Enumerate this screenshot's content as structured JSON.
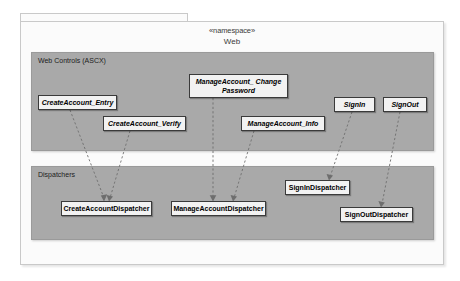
{
  "diagram": {
    "package": {
      "stereotype": "«namespace»",
      "name": "Web"
    },
    "layers": [
      {
        "id": "web-controls",
        "label": "Web Controls (ASCX)",
        "nodes": [
          {
            "id": "manageaccount-changepassword",
            "label": "ManageAccount_ Change\nPassword"
          },
          {
            "id": "createaccount-entry",
            "label": "CreateAccount_Entry"
          },
          {
            "id": "signin",
            "label": "SignIn"
          },
          {
            "id": "signout",
            "label": "SignOut"
          },
          {
            "id": "createaccount-verify",
            "label": "CreateAccount_Verify"
          },
          {
            "id": "manageaccount-info",
            "label": "ManageAccount_Info"
          }
        ]
      },
      {
        "id": "dispatchers",
        "label": "Dispatchers",
        "nodes": [
          {
            "id": "signindispatcher",
            "label": "SignInDispatcher"
          },
          {
            "id": "createaccountdispatcher",
            "label": "CreateAccountDispatcher"
          },
          {
            "id": "manageaccountdispatcher",
            "label": "ManageAccountDispatcher"
          },
          {
            "id": "signoutdispatcher",
            "label": "SignOutDispatcher"
          }
        ]
      }
    ],
    "dependencies": [
      {
        "from": "createaccount-entry",
        "to": "createaccountdispatcher"
      },
      {
        "from": "createaccount-verify",
        "to": "createaccountdispatcher"
      },
      {
        "from": "manageaccount-changepassword",
        "to": "manageaccountdispatcher"
      },
      {
        "from": "manageaccount-info",
        "to": "manageaccountdispatcher"
      },
      {
        "from": "signin",
        "to": "signindispatcher"
      },
      {
        "from": "signout",
        "to": "signoutdispatcher"
      }
    ],
    "colors": {
      "layer_fill": "#a9a9a9",
      "node_fill": "#f2f2f2",
      "node_border": "#3a3a3a",
      "package_fill": "#fbfbfb",
      "connector": "#6e6e6e"
    }
  }
}
